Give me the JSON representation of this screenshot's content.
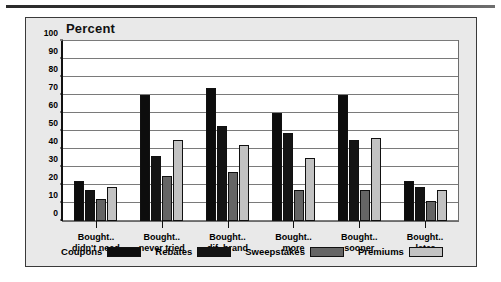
{
  "chart_data": {
    "type": "bar",
    "title": "Percent",
    "xlabel": "",
    "ylabel": "",
    "ylim": [
      0,
      100
    ],
    "yticks": [
      0,
      10,
      20,
      30,
      40,
      50,
      60,
      70,
      80,
      90,
      100
    ],
    "grid": true,
    "legend_position": "bottom",
    "categories": [
      "Bought..\ndidn't need",
      "Bought..\nnever tried",
      "Bought..\ndif. brand",
      "Bought..\nmore",
      "Bought..\nsooner",
      "Bought..\nlater"
    ],
    "category_lines": [
      [
        "Bought..",
        "didn't need"
      ],
      [
        "Bought..",
        "never tried"
      ],
      [
        "Bought..",
        "dif. brand"
      ],
      [
        "Bought..",
        "more"
      ],
      [
        "Bought..",
        "sooner"
      ],
      [
        "Bought..",
        "later"
      ]
    ],
    "series": [
      {
        "name": "Coupons",
        "color": "#0d0d0d",
        "values": [
          22,
          70,
          74,
          60,
          70,
          22
        ]
      },
      {
        "name": "Rebates",
        "color": "#141414",
        "values": [
          17,
          36,
          53,
          49,
          45,
          19
        ]
      },
      {
        "name": "Sweepstakes",
        "color": "#656565",
        "values": [
          12,
          25,
          27,
          17,
          17,
          11
        ]
      },
      {
        "name": "Premiums",
        "color": "#c2c2c2",
        "values": [
          19,
          45,
          42,
          35,
          46,
          17
        ]
      }
    ]
  },
  "legend": {
    "items": [
      {
        "label": "Coupons"
      },
      {
        "label": "Rebates"
      },
      {
        "label": "Sweepstakes"
      },
      {
        "label": "Premiums"
      }
    ]
  }
}
